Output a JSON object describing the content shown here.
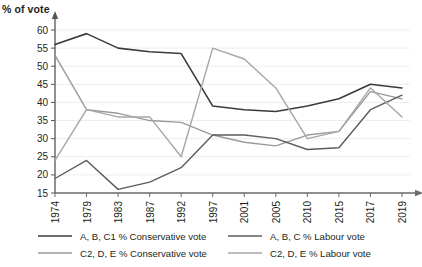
{
  "chart_data": {
    "type": "line",
    "title": "",
    "ylabel": "% of vote",
    "xlabel": "",
    "grid": true,
    "legend_position": "bottom",
    "ylim": [
      15,
      60
    ],
    "ytick_step": 5,
    "ytick_labels": [
      "60",
      "55",
      "50",
      "45",
      "40",
      "35",
      "30",
      "25",
      "20",
      "15"
    ],
    "categories": [
      "1974",
      "1979",
      "1983",
      "1987",
      "1992",
      "1997",
      "2001",
      "2005",
      "2010",
      "2015",
      "2017",
      "2019"
    ],
    "series": [
      {
        "name": "A, B, C1 % Conservative vote",
        "color": "#3b3b3b",
        "width": 1.6,
        "values": [
          56,
          59,
          55,
          54,
          53.5,
          39,
          38,
          37.5,
          39,
          41,
          45,
          44
        ]
      },
      {
        "name": "C2, D, E % Conservative vote",
        "color": "#9a9a9a",
        "width": 1.4,
        "values": [
          53,
          38,
          37,
          35,
          34.5,
          31,
          29,
          28,
          31,
          32,
          43,
          41
        ]
      },
      {
        "name": "A, B, C % Labour vote",
        "color": "#5c5c5c",
        "width": 1.4,
        "values": [
          19,
          24,
          16,
          18,
          22,
          31,
          31,
          30,
          27,
          27.5,
          38,
          42
        ]
      },
      {
        "name": "C2, D, E % Labour vote",
        "color": "#a6a6a6",
        "width": 1.4,
        "values": [
          24,
          38,
          36,
          36,
          25,
          55,
          52,
          44,
          30,
          32,
          44,
          36
        ]
      }
    ]
  },
  "legend": {
    "entries": [
      {
        "label": "A, B, C1 % Conservative vote",
        "color": "#3b3b3b"
      },
      {
        "label": "C2, D, E % Conservative vote",
        "color": "#9a9a9a"
      },
      {
        "label": "A, B, C % Labour vote",
        "color": "#5c5c5c"
      },
      {
        "label": "C2, D, E % Labour vote",
        "color": "#a6a6a6"
      }
    ]
  }
}
